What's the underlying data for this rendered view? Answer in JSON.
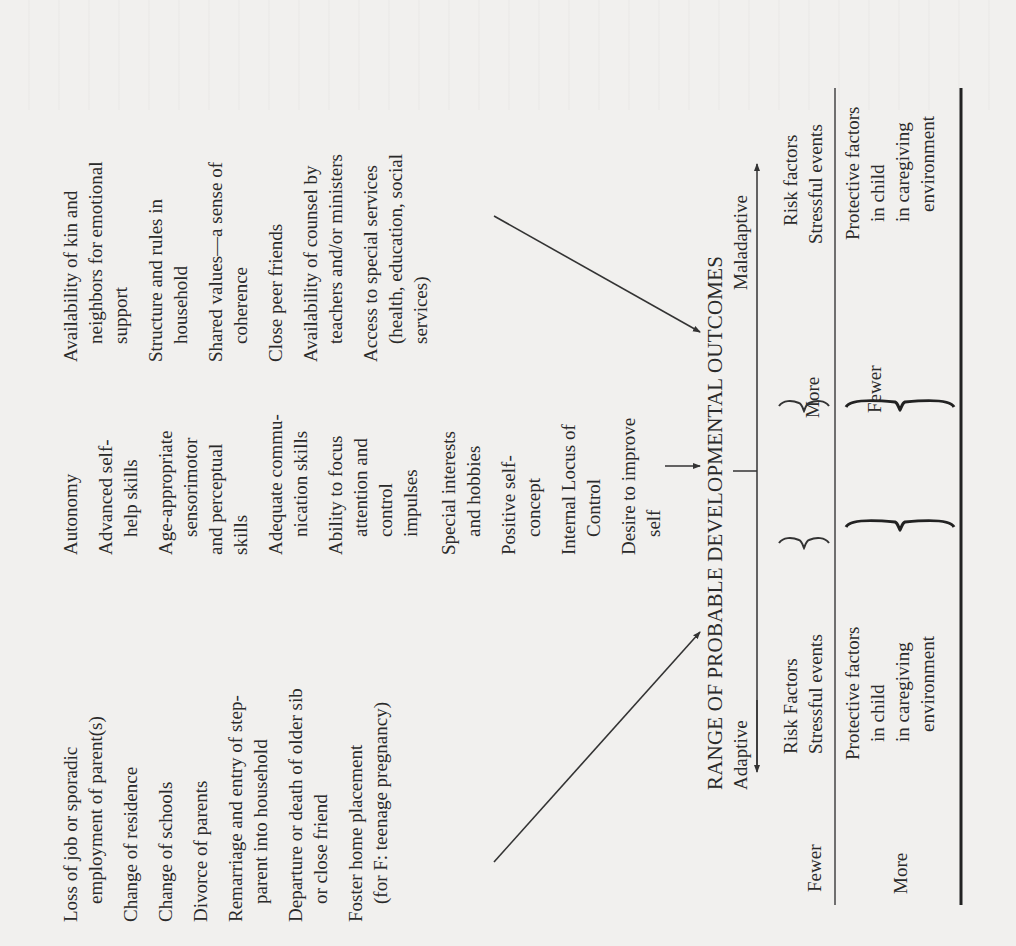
{
  "stressful_events": {
    "items": [
      {
        "lines": [
          "Loss of job or sporadic",
          "employment of parent(s)"
        ]
      },
      {
        "lines": [
          "Change of residence"
        ]
      },
      {
        "lines": [
          "Change of schools"
        ]
      },
      {
        "lines": [
          "Divorce of parents"
        ]
      },
      {
        "lines": [
          "Remarriage and entry of step-",
          "parent into household"
        ]
      },
      {
        "lines": [
          "Departure or death of older sib",
          "or close friend"
        ]
      },
      {
        "lines": [
          "Foster home placement",
          "(for F: teenage pregnancy)"
        ]
      }
    ]
  },
  "protective_factors_child": {
    "items": [
      {
        "lines": [
          "Autonomy"
        ]
      },
      {
        "lines": [
          "Advanced self-",
          "help skills"
        ]
      },
      {
        "lines": [
          "Age-appropriate",
          "sensorimotor",
          "and perceptual",
          "skills"
        ]
      },
      {
        "lines": [
          "Adequate commu-",
          "nication skills"
        ]
      },
      {
        "lines": [
          "Ability to focus",
          "attention and",
          "control",
          "impulses"
        ]
      },
      {
        "lines": [
          "Special interests",
          "and hobbies"
        ]
      },
      {
        "lines": [
          "Positive self-",
          "concept"
        ]
      },
      {
        "lines": [
          "Internal Locus of",
          "Control"
        ]
      },
      {
        "lines": [
          "Desire to improve",
          "self"
        ]
      }
    ]
  },
  "protective_factors_environment": {
    "items": [
      {
        "lines": [
          "Availability of kin and",
          "neighbors for emotional",
          "support"
        ]
      },
      {
        "lines": [
          "Structure and rules in",
          "household"
        ]
      },
      {
        "lines": [
          "Shared values—a sense of",
          "coherence"
        ]
      },
      {
        "lines": [
          "Close peer friends"
        ]
      },
      {
        "lines": [
          "Availability of counsel by",
          "teachers and/or ministers"
        ]
      },
      {
        "lines": [
          "Access to special services",
          "(health, education, social",
          "services)"
        ]
      }
    ]
  },
  "outcomes": {
    "title": "RANGE OF PROBABLE DEVELOPMENTAL OUTCOMES",
    "left_label": "Adaptive",
    "right_label": "Maladaptive"
  },
  "table": {
    "left": {
      "risk_quantity": "Fewer",
      "risk_label": [
        "Risk Factors",
        "Stressful events"
      ],
      "protective_quantity": "More",
      "protective_label": [
        "Protective factors",
        "in child",
        "in caregiving",
        "environment"
      ]
    },
    "middle": {
      "risk_quantity": "More",
      "protective_quantity": "Fewer"
    },
    "right": {
      "risk_label": [
        "Risk factors",
        "Stressful events"
      ],
      "protective_label": [
        "Protective factors",
        "in child",
        "in caregiving",
        "environment"
      ]
    }
  }
}
